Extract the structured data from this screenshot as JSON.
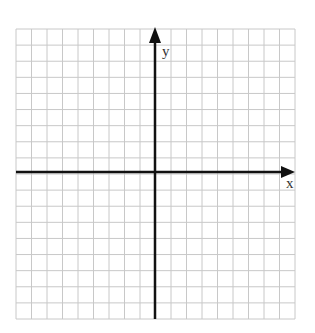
{
  "diagram": {
    "type": "coordinate-plane",
    "grid": {
      "columns": 18,
      "rows": 18,
      "left": 16,
      "top": 29,
      "right": 295,
      "bottom": 319,
      "line_color": "#c8c8c8"
    },
    "origin": {
      "x": 155,
      "y": 172
    },
    "axes": {
      "color": "#111111",
      "x_label": "x",
      "y_label": "y"
    }
  }
}
